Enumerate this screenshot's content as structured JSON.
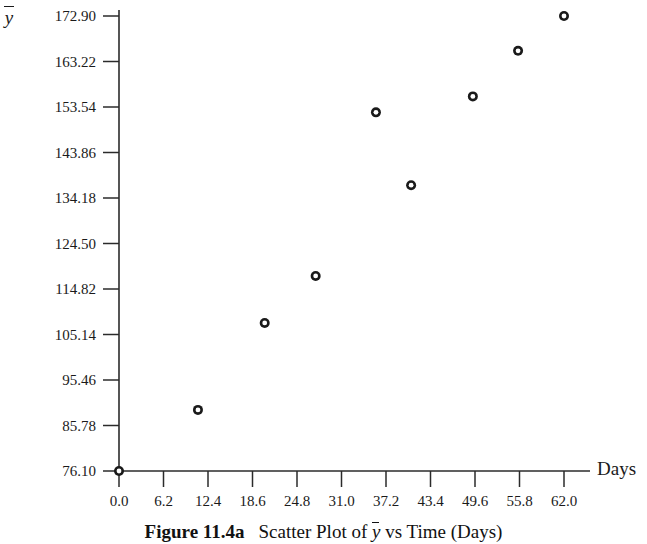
{
  "figure": {
    "caption_label": "Figure 11.4a",
    "caption_text_before": "Scatter Plot of ",
    "caption_ybar": "y",
    "caption_text_after": " vs Time (Days)"
  },
  "axes": {
    "y_axis_label": "y",
    "x_axis_label": "Days"
  },
  "chart_data": {
    "type": "scatter",
    "xlabel": "Days",
    "ylabel": "ȳ",
    "grid": false,
    "legend": null,
    "marker": "open-circle",
    "xlim": [
      0.0,
      62.0
    ],
    "ylim": [
      76.1,
      172.9
    ],
    "xticks": [
      "0.0",
      "6.2",
      "12.4",
      "18.6",
      "24.8",
      "31.0",
      "37.2",
      "43.4",
      "49.6",
      "55.8",
      "62.0"
    ],
    "xtick_values": [
      0.0,
      6.2,
      12.4,
      18.6,
      24.8,
      31.0,
      37.2,
      43.4,
      49.6,
      55.8,
      62.0
    ],
    "yticks": [
      "76.10",
      "85.78",
      "95.46",
      "105.14",
      "114.82",
      "124.50",
      "134.18",
      "143.86",
      "153.54",
      "163.22",
      "172.90"
    ],
    "ytick_values": [
      76.1,
      85.78,
      95.46,
      105.14,
      114.82,
      124.5,
      134.18,
      143.86,
      153.54,
      163.22,
      172.9
    ],
    "x": [
      0.0,
      11.0,
      20.3,
      27.4,
      35.8,
      40.7,
      49.3,
      55.6,
      62.0
    ],
    "y": [
      76.1,
      89.1,
      107.6,
      117.6,
      152.4,
      136.9,
      155.8,
      165.5,
      172.9
    ],
    "points": [
      {
        "x": 0.0,
        "y": 76.1
      },
      {
        "x": 11.0,
        "y": 89.1
      },
      {
        "x": 20.3,
        "y": 107.6
      },
      {
        "x": 27.4,
        "y": 117.6
      },
      {
        "x": 35.8,
        "y": 152.4
      },
      {
        "x": 40.7,
        "y": 136.9
      },
      {
        "x": 49.3,
        "y": 155.8
      },
      {
        "x": 55.6,
        "y": 165.5
      },
      {
        "x": 62.0,
        "y": 172.9
      }
    ]
  },
  "colors": {
    "axis": "#2b2b2b",
    "text": "#1a1a1a",
    "marker": "#1a1a1a",
    "background": "#ffffff"
  }
}
